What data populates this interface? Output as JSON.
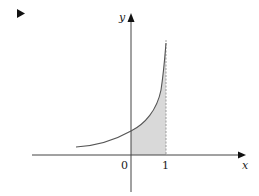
{
  "marker": {
    "icon": "play-triangle-icon"
  },
  "diagram": {
    "axes": {
      "x_label": "x",
      "y_label": "y",
      "tick_labels": [
        "0",
        "1"
      ]
    },
    "curve": "exponential-like increasing curve",
    "shaded_region": {
      "from": "0",
      "to": "1",
      "fill": "#d9d9d9"
    },
    "colors": {
      "axis": "#444444",
      "curve": "#555555",
      "dashed": "#888888",
      "shade": "#d9d9d9"
    }
  }
}
